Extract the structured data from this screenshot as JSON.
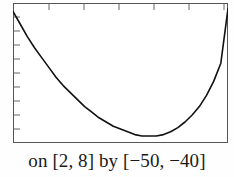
{
  "figure": {
    "caption": "on [2, 8] by [−50, −40]",
    "caption_parts": {
      "prefix": "on",
      "x_interval": "[2, 8]",
      "connector": "by",
      "y_interval": "[−50, −40]"
    },
    "colors": {
      "frame": "#555555",
      "curve": "#111111",
      "tick": "#666666",
      "background": "#ffffff",
      "caption_text": "#1a1a1a"
    }
  },
  "chart_data": {
    "type": "line",
    "title": "",
    "subtitle": "",
    "xlabel": "",
    "ylabel": "",
    "xlim": [
      2,
      8
    ],
    "ylim": [
      -50,
      -40
    ],
    "grid": false,
    "legend": null,
    "axis_style": "graphing-calculator-window",
    "x_tick_count": 6,
    "y_tick_count": 9,
    "x_ticks": [
      3,
      4,
      5,
      6,
      7,
      8
    ],
    "y_ticks": [
      -49,
      -48,
      -47,
      -46,
      -45,
      -44,
      -43,
      -42,
      -41
    ],
    "tick_side_x": "top",
    "tick_side_y": "left",
    "annotations": [],
    "series": [
      {
        "name": "curve",
        "shape": "parabola",
        "x": [
          2.0,
          2.2,
          2.4,
          2.6,
          2.8,
          3.0,
          3.2,
          3.4,
          3.6,
          3.8,
          4.0,
          4.2,
          4.4,
          4.6,
          4.8,
          5.0,
          5.2,
          5.4,
          5.6,
          5.8,
          6.0,
          6.2,
          6.4,
          6.6,
          6.8,
          7.0,
          7.2,
          7.4,
          7.6,
          7.8,
          8.0
        ],
        "y": [
          -40.6,
          -41.5,
          -42.4,
          -43.2,
          -43.9,
          -44.6,
          -45.3,
          -45.9,
          -46.4,
          -46.9,
          -47.4,
          -47.8,
          -48.2,
          -48.5,
          -48.8,
          -49.0,
          -49.2,
          -49.4,
          -49.5,
          -49.5,
          -49.5,
          -49.4,
          -49.2,
          -48.9,
          -48.5,
          -48.0,
          -47.4,
          -46.6,
          -45.6,
          -44.3,
          -40.4
        ]
      }
    ]
  }
}
